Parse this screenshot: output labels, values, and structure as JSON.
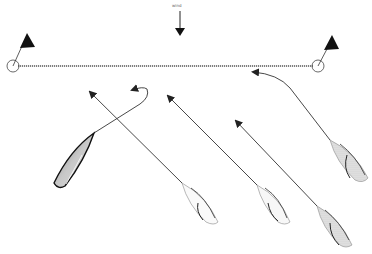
{
  "diagram": {
    "wind_label": "wind",
    "colors": {
      "line": "#333333",
      "flag": "#111111",
      "start_line": "#555555",
      "hull_gray": "#d8d8d8",
      "hull_dark": "#9a9a9a"
    },
    "start_line": {
      "x1": 13,
      "y1": 66,
      "x2": 318,
      "y2": 66,
      "style": "dotted"
    },
    "marks": [
      {
        "name": "left-committee-mark",
        "cx": 13,
        "cy": 66,
        "r": 6,
        "flag": {
          "x": 22,
          "y": 36
        }
      },
      {
        "name": "right-pin-mark",
        "cx": 318,
        "cy": 66,
        "r": 6,
        "flag": {
          "x": 330,
          "y": 38
        }
      }
    ],
    "boats": [
      {
        "id": "boat-a",
        "fill": "dark",
        "bow": [
          95,
          133
        ],
        "course": "curved-left-then-up"
      },
      {
        "id": "boat-b",
        "fill": "light",
        "bow": [
          180,
          180
        ],
        "course": "straight-upwind"
      },
      {
        "id": "boat-c",
        "fill": "light",
        "bow": [
          256,
          183
        ],
        "course": "straight-upwind"
      },
      {
        "id": "boat-d",
        "fill": "light",
        "bow": [
          320,
          205
        ],
        "course": "straight-upwind"
      },
      {
        "id": "boat-e",
        "fill": "light",
        "bow": [
          333,
          145
        ],
        "course": "curved-to-start"
      }
    ]
  }
}
